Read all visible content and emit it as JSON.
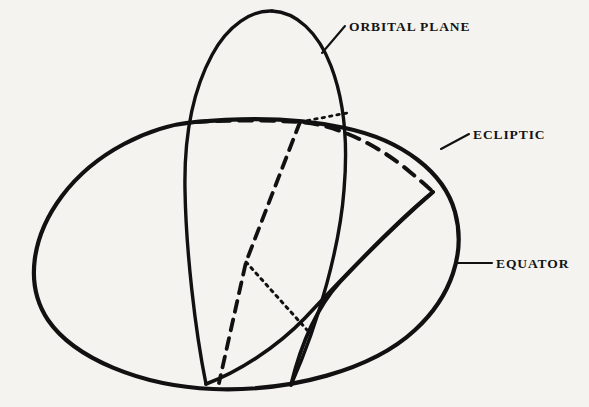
{
  "figure": {
    "background_color": "#f4f3f0",
    "ink_color": "#111111",
    "width": 589,
    "height": 407
  },
  "labels": {
    "orbital_plane": "ORBITAL PLANE",
    "ecliptic": "ECLIPTIC",
    "equator": "EQUATOR"
  },
  "diagram_data": {
    "type": "diagram",
    "elements": [
      {
        "name": "equator",
        "style": "solid",
        "description": "Large tilted ellipse forming the celestial equator, drawn as a full closed curve",
        "label": "EQUATOR"
      },
      {
        "name": "orbital-plane",
        "style": "solid",
        "description": "Tall narrow ellipse inclined steeply, crossing the equator near the upper left and converging at the lower nodes",
        "label": "ORBITAL PLANE"
      },
      {
        "name": "ecliptic",
        "style": "dashed-behind-solid-front",
        "description": "Great circle inclined to the equator; dashed where it passes behind the sphere and solid where it passes in front",
        "label": "ECLIPTIC"
      },
      {
        "name": "node-line-dashed",
        "style": "dashed",
        "description": "Line of nodes running from the upper ecliptic intersection down to the lower left convergence point"
      },
      {
        "name": "node-line-dotted",
        "style": "dotted",
        "description": "Fine dotted line from the orbital plane intersection toward the lower right convergence point"
      }
    ],
    "intersection_points": [
      {
        "name": "ascending-node-left",
        "x": 195,
        "y": 122
      },
      {
        "name": "ecliptic-orbital-node-upper",
        "x": 300,
        "y": 122
      },
      {
        "name": "descending-node-right",
        "x": 432,
        "y": 192
      },
      {
        "name": "mid-node",
        "x": 246,
        "y": 262
      },
      {
        "name": "lower-convergence-left",
        "x": 206,
        "y": 384
      },
      {
        "name": "lower-convergence-right",
        "x": 291,
        "y": 385
      }
    ]
  }
}
